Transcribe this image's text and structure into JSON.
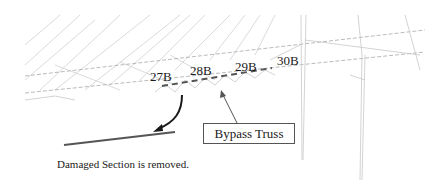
{
  "diagram": {
    "panel_labels": [
      {
        "id": "27B",
        "text": "27B",
        "x": 150,
        "y": 70
      },
      {
        "id": "28B",
        "text": "28B",
        "x": 190,
        "y": 64
      },
      {
        "id": "29B",
        "text": "29B",
        "x": 235,
        "y": 60
      },
      {
        "id": "30B",
        "text": "30B",
        "x": 277,
        "y": 54
      }
    ],
    "callout": {
      "text": "Bypass Truss"
    },
    "caption": "Damaged Section is removed.",
    "colors": {
      "wireframe": "#c8c8c8",
      "dashed_chord": "#9a9a9a",
      "bypass_truss": "#555555",
      "removed_member": "#555555",
      "arrow": "#1a1a1a"
    }
  }
}
